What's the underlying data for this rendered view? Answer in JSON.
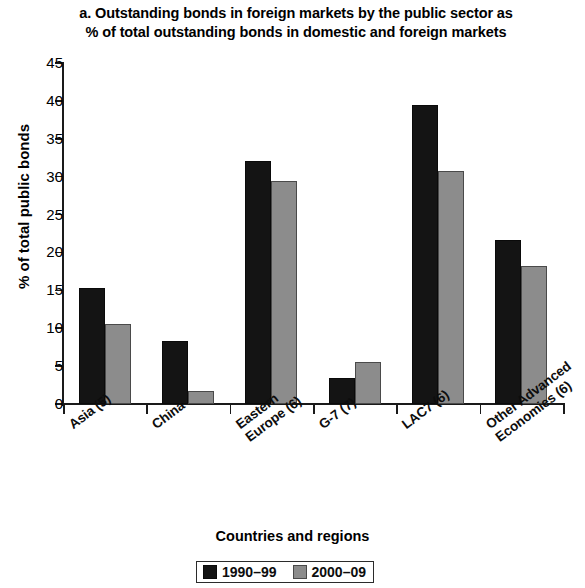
{
  "chart_data": {
    "type": "bar",
    "title": "a. Outstanding bonds in foreign markets by the public sector as % of total outstanding bonds in domestic and foreign markets",
    "title_lines": [
      "a. Outstanding bonds in foreign markets by the public sector as",
      "% of total outstanding bonds in domestic and foreign markets"
    ],
    "xlabel": "Countries and regions",
    "ylabel": "% of total public bonds",
    "ylim": [
      0,
      45
    ],
    "ytick_step": 5,
    "yticks": [
      0,
      5,
      10,
      15,
      20,
      25,
      30,
      35,
      40,
      45
    ],
    "ytick_labels": [
      "0",
      "5",
      "10",
      "15",
      "20",
      "25",
      "30",
      "35",
      "40",
      "45"
    ],
    "grid": false,
    "legend_position": "bottom",
    "categories": [
      "Asia (5)",
      "China",
      "Eastern Europe (6)",
      "G-7 (7)",
      "LAC7 (6)",
      "Other Advanced Economies (6)"
    ],
    "category_lines": [
      [
        "Asia (5)"
      ],
      [
        "China"
      ],
      [
        "Eastern",
        "Europe (6)"
      ],
      [
        "G-7 (7)"
      ],
      [
        "LAC7 (6)"
      ],
      [
        "Other Advanced",
        "Economies (6)"
      ]
    ],
    "series": [
      {
        "name": "1990–99",
        "color": "#141414",
        "values": [
          15.3,
          8.3,
          32.1,
          3.4,
          39.5,
          21.6
        ]
      },
      {
        "name": "2000–09",
        "color": "#8c8c8c",
        "values": [
          10.6,
          1.7,
          29.4,
          5.6,
          30.7,
          18.2
        ]
      }
    ]
  }
}
